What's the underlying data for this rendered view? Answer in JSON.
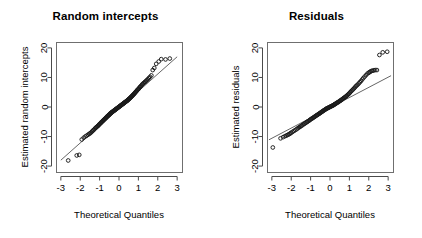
{
  "figure": {
    "background": "#ffffff",
    "panels": 2,
    "point_color": "#1a1a1a",
    "line_color": "#555555"
  },
  "chart_data": [
    {
      "type": "scatter",
      "title": "Random intercepts",
      "xlabel": "Theoretical Quantiles",
      "ylabel": "Estimated random intercepts",
      "xlim": [
        -3.25,
        3.25
      ],
      "ylim": [
        -22,
        22
      ],
      "xticks": [
        "-3",
        "-2",
        "-1",
        "0",
        "1",
        "2",
        "3"
      ],
      "xtick_values": [
        -3,
        -2,
        -1,
        0,
        1,
        2,
        3
      ],
      "yticks": [
        "20",
        "10",
        "0",
        "-10",
        "-20"
      ],
      "ytick_values": [
        20,
        10,
        0,
        -10,
        -20
      ],
      "grid": false,
      "legend": "none",
      "reference_line": {
        "x": [
          -3.0,
          3.0
        ],
        "y": [
          -18.0,
          17.0
        ],
        "style": "solid"
      },
      "x": [
        -2.62,
        -2.18,
        -2.05,
        -1.92,
        -1.82,
        -1.74,
        -1.67,
        -1.6,
        -1.54,
        -1.49,
        -1.44,
        -1.39,
        -1.35,
        -1.31,
        -1.27,
        -1.23,
        -1.19,
        -1.16,
        -1.12,
        -1.09,
        -1.06,
        -1.03,
        -1.0,
        -0.97,
        -0.94,
        -0.92,
        -0.89,
        -0.86,
        -0.84,
        -0.81,
        -0.79,
        -0.76,
        -0.74,
        -0.71,
        -0.69,
        -0.67,
        -0.64,
        -0.62,
        -0.6,
        -0.58,
        -0.55,
        -0.53,
        -0.51,
        -0.49,
        -0.47,
        -0.45,
        -0.43,
        -0.41,
        -0.39,
        -0.37,
        -0.35,
        -0.33,
        -0.31,
        -0.29,
        -0.27,
        -0.25,
        -0.23,
        -0.21,
        -0.19,
        -0.17,
        -0.15,
        -0.13,
        -0.11,
        -0.09,
        -0.07,
        -0.05,
        -0.03,
        -0.01,
        0.01,
        0.03,
        0.05,
        0.07,
        0.09,
        0.11,
        0.13,
        0.15,
        0.17,
        0.19,
        0.21,
        0.23,
        0.25,
        0.27,
        0.29,
        0.31,
        0.33,
        0.35,
        0.37,
        0.39,
        0.41,
        0.43,
        0.45,
        0.47,
        0.49,
        0.51,
        0.53,
        0.55,
        0.58,
        0.6,
        0.62,
        0.64,
        0.67,
        0.69,
        0.71,
        0.74,
        0.76,
        0.79,
        0.81,
        0.84,
        0.86,
        0.89,
        0.92,
        0.94,
        0.97,
        1.0,
        1.03,
        1.06,
        1.09,
        1.12,
        1.16,
        1.19,
        1.23,
        1.27,
        1.31,
        1.35,
        1.39,
        1.44,
        1.49,
        1.54,
        1.6,
        1.67,
        1.74,
        1.82,
        1.92,
        2.05,
        2.18,
        2.4,
        2.62
      ],
      "y": [
        -18.1,
        -16.4,
        -16.2,
        -11.0,
        -10.4,
        -10.0,
        -9.7,
        -9.4,
        -9.1,
        -8.9,
        -8.6,
        -8.3,
        -8.0,
        -7.8,
        -7.5,
        -7.2,
        -7.0,
        -6.8,
        -6.6,
        -6.4,
        -6.2,
        -6.0,
        -5.8,
        -5.6,
        -5.4,
        -5.2,
        -5.1,
        -4.9,
        -4.7,
        -4.6,
        -4.4,
        -4.2,
        -4.1,
        -3.9,
        -3.8,
        -3.6,
        -3.5,
        -3.3,
        -3.2,
        -3.0,
        -2.9,
        -2.8,
        -2.6,
        -2.5,
        -2.4,
        -2.2,
        -2.1,
        -2.0,
        -1.9,
        -1.8,
        -1.7,
        -1.6,
        -1.5,
        -1.4,
        -1.3,
        -1.2,
        -1.1,
        -1.0,
        -0.9,
        -0.8,
        -0.7,
        -0.6,
        -0.5,
        -0.4,
        -0.3,
        -0.2,
        -0.1,
        0.0,
        0.1,
        0.2,
        0.3,
        0.4,
        0.5,
        0.6,
        0.7,
        0.8,
        0.9,
        1.0,
        1.1,
        1.2,
        1.3,
        1.4,
        1.5,
        1.6,
        1.7,
        1.8,
        1.9,
        2.0,
        2.1,
        2.2,
        2.3,
        2.4,
        2.6,
        2.7,
        2.8,
        2.9,
        3.1,
        3.2,
        3.4,
        3.5,
        3.7,
        3.8,
        4.0,
        4.2,
        4.3,
        4.5,
        4.7,
        4.9,
        5.1,
        5.3,
        5.5,
        5.7,
        5.9,
        6.1,
        6.3,
        6.6,
        6.8,
        7.0,
        7.3,
        7.6,
        7.8,
        8.1,
        8.3,
        8.5,
        8.8,
        9.1,
        9.4,
        9.8,
        10.2,
        10.7,
        12.5,
        13.2,
        14.6,
        15.4,
        16.2,
        16.1,
        16.4
      ]
    },
    {
      "type": "scatter",
      "title": "Residuals",
      "xlabel": "Theoretical Quantiles",
      "ylabel": "Estimated residuals",
      "xlim": [
        -3.25,
        3.25
      ],
      "ylim": [
        -22,
        22
      ],
      "xticks": [
        "-3",
        "-2",
        "-1",
        "0",
        "1",
        "2",
        "3"
      ],
      "xtick_values": [
        -3,
        -2,
        -1,
        0,
        1,
        2,
        3
      ],
      "yticks": [
        "20",
        "10",
        "0",
        "-10",
        "-20"
      ],
      "ytick_values": [
        20,
        10,
        0,
        -10,
        -20
      ],
      "grid": false,
      "legend": "none",
      "reference_line": {
        "x": [
          -3.15,
          3.15
        ],
        "y": [
          -11.1,
          10.6
        ],
        "style": "solid"
      },
      "x": [
        -2.95,
        -2.55,
        -2.42,
        -2.33,
        -2.26,
        -2.2,
        -2.14,
        -2.09,
        -2.04,
        -2.0,
        -1.93,
        -1.86,
        -1.79,
        -1.72,
        -1.66,
        -1.6,
        -1.54,
        -1.49,
        -1.43,
        -1.38,
        -1.33,
        -1.28,
        -1.24,
        -1.19,
        -1.15,
        -1.1,
        -1.06,
        -1.02,
        -0.98,
        -0.94,
        -0.9,
        -0.86,
        -0.82,
        -0.79,
        -0.75,
        -0.71,
        -0.68,
        -0.64,
        -0.61,
        -0.57,
        -0.54,
        -0.51,
        -0.47,
        -0.44,
        -0.41,
        -0.38,
        -0.34,
        -0.31,
        -0.28,
        -0.25,
        -0.22,
        -0.19,
        -0.16,
        -0.13,
        -0.1,
        -0.07,
        -0.04,
        -0.01,
        0.02,
        0.05,
        0.08,
        0.11,
        0.14,
        0.17,
        0.2,
        0.23,
        0.26,
        0.29,
        0.32,
        0.35,
        0.38,
        0.42,
        0.45,
        0.48,
        0.51,
        0.55,
        0.58,
        0.61,
        0.65,
        0.68,
        0.72,
        0.75,
        0.79,
        0.83,
        0.86,
        0.9,
        0.94,
        0.98,
        1.02,
        1.06,
        1.1,
        1.15,
        1.19,
        1.24,
        1.28,
        1.33,
        1.38,
        1.43,
        1.49,
        1.54,
        1.6,
        1.66,
        1.72,
        1.79,
        1.86,
        1.93,
        2.0,
        2.04,
        2.09,
        2.14,
        2.2,
        2.26,
        2.33,
        2.42,
        2.55,
        2.72,
        2.95
      ],
      "y": [
        -13.7,
        -10.6,
        -10.2,
        -9.9,
        -9.7,
        -9.5,
        -9.3,
        -9.1,
        -8.9,
        -8.7,
        -8.4,
        -8.1,
        -7.8,
        -7.5,
        -7.2,
        -6.9,
        -6.7,
        -6.4,
        -6.2,
        -5.9,
        -5.7,
        -5.5,
        -5.3,
        -5.1,
        -4.9,
        -4.7,
        -4.5,
        -4.3,
        -4.1,
        -3.9,
        -3.8,
        -3.6,
        -3.4,
        -3.3,
        -3.1,
        -2.9,
        -2.8,
        -2.6,
        -2.5,
        -2.3,
        -2.2,
        -2.0,
        -1.9,
        -1.7,
        -1.6,
        -1.4,
        -1.3,
        -1.1,
        -1.0,
        -0.9,
        -0.7,
        -0.6,
        -0.5,
        -0.4,
        -0.3,
        -0.2,
        -0.1,
        0.0,
        0.1,
        0.2,
        0.3,
        0.4,
        0.5,
        0.6,
        0.7,
        0.9,
        1.0,
        1.1,
        1.2,
        1.4,
        1.5,
        1.6,
        1.8,
        1.9,
        2.1,
        2.2,
        2.4,
        2.5,
        2.7,
        2.9,
        3.1,
        3.2,
        3.4,
        3.6,
        3.8,
        4.0,
        4.3,
        4.5,
        4.8,
        5.1,
        5.4,
        5.7,
        6.0,
        6.3,
        6.6,
        7.0,
        7.3,
        7.6,
        8.0,
        8.4,
        8.8,
        9.3,
        9.8,
        10.3,
        10.8,
        11.3,
        11.6,
        11.8,
        12.0,
        12.2,
        12.3,
        12.4,
        12.5,
        12.5,
        17.6,
        18.5,
        18.7
      ]
    }
  ]
}
